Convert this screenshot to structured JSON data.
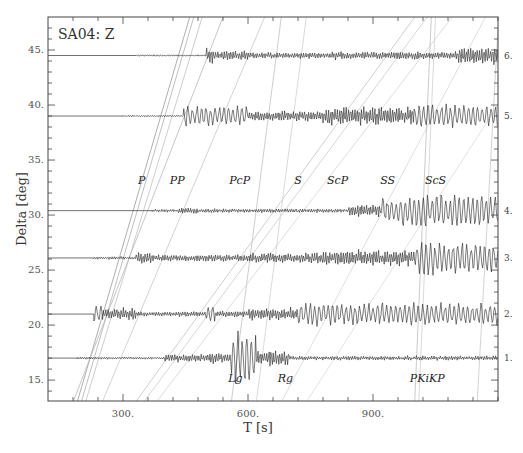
{
  "chart_data": {
    "type": "line",
    "title": "SA04: Z",
    "xlabel": "T  [s]",
    "ylabel": "Delta [deg]",
    "xlim": [
      120,
      1200
    ],
    "ylim": [
      13.1,
      48
    ],
    "grid": false,
    "x_ticks_major": [
      300,
      600,
      900
    ],
    "x_tick_labels": [
      "300.",
      "600.",
      "900."
    ],
    "x_ticks_minor_step": 60,
    "y_ticks_major": [
      15,
      20,
      25,
      30,
      35,
      40,
      45
    ],
    "y_tick_labels": [
      "15.",
      "20.",
      "25.",
      "30.",
      "35.",
      "40.",
      "45."
    ],
    "y_ticks_minor_step": 1,
    "traces": [
      {
        "label": "1.",
        "delta": 17.0,
        "start": 190,
        "segments": [
          [
            190,
            400,
            1.2
          ],
          [
            400,
            505,
            4
          ],
          [
            505,
            560,
            6
          ],
          [
            560,
            620,
            26
          ],
          [
            620,
            700,
            8
          ],
          [
            700,
            1200,
            2.2
          ]
        ]
      },
      {
        "label": "2.",
        "delta": 21.0,
        "start": 230,
        "segments": [
          [
            120,
            230,
            0
          ],
          [
            230,
            250,
            10
          ],
          [
            250,
            330,
            6
          ],
          [
            330,
            500,
            2.5
          ],
          [
            500,
            520,
            10
          ],
          [
            520,
            600,
            3
          ],
          [
            600,
            720,
            6
          ],
          [
            720,
            1200,
            11
          ]
        ]
      },
      {
        "label": "3.",
        "delta": 26.1,
        "start": 230,
        "segments": [
          [
            230,
            330,
            1.5
          ],
          [
            330,
            370,
            6
          ],
          [
            370,
            600,
            3.5
          ],
          [
            600,
            780,
            5
          ],
          [
            780,
            1000,
            8
          ],
          [
            1000,
            1200,
            16
          ]
        ]
      },
      {
        "label": "4.",
        "delta": 30.4,
        "start": 370,
        "segments": [
          [
            370,
            430,
            1.5
          ],
          [
            430,
            480,
            3
          ],
          [
            480,
            840,
            2
          ],
          [
            840,
            920,
            6
          ],
          [
            920,
            1200,
            16
          ]
        ]
      },
      {
        "label": "5.",
        "delta": 39.0,
        "start": 300,
        "segments": [
          [
            300,
            445,
            0.8
          ],
          [
            445,
            460,
            14
          ],
          [
            460,
            600,
            10
          ],
          [
            600,
            780,
            5
          ],
          [
            780,
            1000,
            9
          ],
          [
            1000,
            1200,
            11
          ]
        ]
      },
      {
        "label": "6.",
        "delta": 44.5,
        "start": 330,
        "segments": [
          [
            330,
            500,
            0.8
          ],
          [
            500,
            515,
            8
          ],
          [
            515,
            600,
            5
          ],
          [
            600,
            800,
            3
          ],
          [
            800,
            1100,
            4
          ],
          [
            1100,
            1200,
            8
          ]
        ]
      }
    ],
    "phases": [
      {
        "name": "P",
        "label_x": 345,
        "label_delta": 32.8
      },
      {
        "name": "PP",
        "label_x": 430,
        "label_delta": 32.8
      },
      {
        "name": "PcP",
        "label_x": 580,
        "label_delta": 32.8
      },
      {
        "name": "S",
        "label_x": 720,
        "label_delta": 32.8
      },
      {
        "name": "ScP",
        "label_x": 815,
        "label_delta": 32.8
      },
      {
        "name": "SS",
        "label_x": 935,
        "label_delta": 32.8
      },
      {
        "name": "ScS",
        "label_x": 1050,
        "label_delta": 32.8
      },
      {
        "name": "Lg",
        "label_x": 570,
        "label_delta": 14.8
      },
      {
        "name": "Rg",
        "label_x": 690,
        "label_delta": 14.8
      },
      {
        "name": "PKiKP",
        "label_x": 1030,
        "label_delta": 14.8
      }
    ],
    "travel_time_curves": [
      {
        "pts": [
          [
            190,
            13
          ],
          [
            460,
            48
          ]
        ],
        "shade": "#9a9a9a"
      },
      {
        "pts": [
          [
            200,
            13
          ],
          [
            470,
            48
          ]
        ],
        "shade": "#b0b0b0"
      },
      {
        "pts": [
          [
            210,
            13
          ],
          [
            490,
            48
          ]
        ],
        "shade": "#c0c0c0"
      },
      {
        "pts": [
          [
            180,
            13
          ],
          [
            540,
            48
          ]
        ],
        "shade": "#b8b8b8"
      },
      {
        "pts": [
          [
            250,
            13
          ],
          [
            640,
            48
          ]
        ],
        "shade": "#c8c8c8"
      },
      {
        "pts": [
          [
            560,
            13
          ],
          [
            680,
            48
          ]
        ],
        "shade": "#c0c0c0"
      },
      {
        "pts": [
          [
            330,
            13
          ],
          [
            1000,
            48
          ]
        ],
        "shade": "#c4c4c4"
      },
      {
        "pts": [
          [
            350,
            13
          ],
          [
            1030,
            48
          ]
        ],
        "shade": "#cccccc"
      },
      {
        "pts": [
          [
            380,
            13
          ],
          [
            1090,
            48
          ]
        ],
        "shade": "#d4d4d4"
      },
      {
        "pts": [
          [
            620,
            13
          ],
          [
            740,
            48
          ]
        ],
        "shade": "#d0d0d0"
      },
      {
        "pts": [
          [
            680,
            13
          ],
          [
            1170,
            48
          ]
        ],
        "shade": "#d6d6d6"
      },
      {
        "pts": [
          [
            740,
            13
          ],
          [
            1200,
            40
          ]
        ],
        "shade": "#dadada"
      },
      {
        "pts": [
          [
            1000,
            13
          ],
          [
            1040,
            48
          ]
        ],
        "shade": "#bdbdbd"
      },
      {
        "pts": [
          [
            1010,
            13
          ],
          [
            1050,
            48
          ]
        ],
        "shade": "#cfcfcf"
      },
      {
        "pts": [
          [
            1150,
            13
          ],
          [
            1200,
            47
          ]
        ],
        "shade": "#c8c8c8"
      }
    ]
  }
}
